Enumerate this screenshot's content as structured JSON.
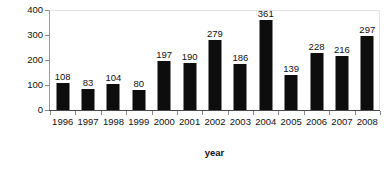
{
  "chart_data": {
    "type": "bar",
    "title": "",
    "xlabel": "year",
    "ylabel": "Number of cases",
    "categories": [
      "1996",
      "1997",
      "1998",
      "1999",
      "2000",
      "2001",
      "2002",
      "2003",
      "2004",
      "2005",
      "2006",
      "2007",
      "2008"
    ],
    "values": [
      108,
      83,
      104,
      80,
      197,
      190,
      279,
      186,
      361,
      139,
      228,
      216,
      297
    ],
    "series": [
      {
        "name": "Number of cases",
        "values": [
          108,
          83,
          104,
          80,
          197,
          190,
          279,
          186,
          361,
          139,
          228,
          216,
          297
        ]
      }
    ],
    "ylim": [
      0,
      400
    ],
    "yticks": [
      0,
      100,
      200,
      300,
      400
    ],
    "ytick_labels": [
      "0",
      "100",
      "200",
      "300",
      "400"
    ],
    "grid": false,
    "legend": false,
    "legend_position": "none",
    "data_labels": true,
    "bar_color": "#0d0d0d",
    "plot_background": "#ffffff",
    "axis_color": "#4a4a4a",
    "frame_color": "#e2e2e2",
    "text_color": "#111111"
  }
}
